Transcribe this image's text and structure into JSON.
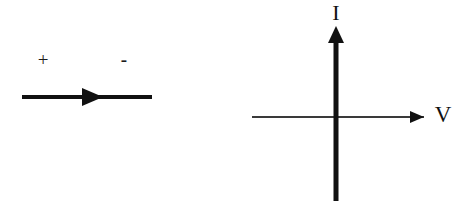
{
  "figure": {
    "width": 468,
    "height": 203,
    "background_color": "#ffffff",
    "ink_color": "#111111"
  },
  "diagrams": {
    "left": {
      "name": "current-direction-diagram",
      "description": "Horizontal conductor line with a solid right-pointing arrowhead, marked plus on the left and minus on the right",
      "polarity": {
        "plus_label": "+",
        "minus_label": "-"
      },
      "line": {
        "x1": 22,
        "x2": 152,
        "y": 97,
        "thickness": 4,
        "color": "#111111"
      },
      "arrowhead": {
        "direction": "right",
        "tip_x": 103,
        "base_x": 82,
        "center_y": 97,
        "half_height": 9,
        "color": "#111111"
      },
      "plus_position": {
        "x": 43,
        "y": 62
      },
      "minus_position": {
        "x": 124,
        "y": 62
      }
    },
    "right": {
      "name": "iv-axes-diagram",
      "description": "Cartesian axes for an I versus V characteristic plot with arrowheads on the positive I and positive V directions",
      "origin": {
        "x": 336,
        "y": 117
      },
      "vertical_axis": {
        "label": "I",
        "label_position": {
          "x": 336,
          "y": 15
        },
        "x": 336,
        "y_top": 26,
        "y_bottom": 201,
        "thickness": 5,
        "color": "#111111",
        "arrowhead": {
          "direction": "up",
          "tip_y": 26,
          "base_y": 42,
          "half_width": 8
        }
      },
      "horizontal_axis": {
        "label": "V",
        "label_position": {
          "x": 443,
          "y": 117
        },
        "y": 117,
        "x_left": 252,
        "x_right": 424,
        "thickness": 2,
        "color": "#3a3a3a",
        "arrowhead": {
          "direction": "right",
          "tip_x": 424,
          "base_x": 410,
          "half_height": 6
        }
      }
    }
  }
}
